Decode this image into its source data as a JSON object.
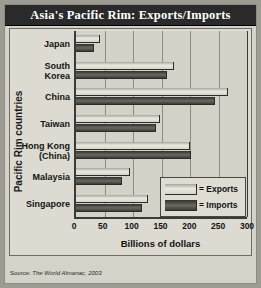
{
  "title": "Asia's Pacific Rim: Exports/Imports",
  "source": {
    "label": "Source:",
    "value": "The World Almanac, 2003"
  },
  "legend": {
    "exports": "= Exports",
    "imports": "= Imports"
  },
  "colors": {
    "title_bar": "#2a2a2a",
    "title_text": "#ffffff",
    "page_background": "#d4d2c9",
    "plot_background": "#d3d1c8",
    "exports_bar": "#d7d5cc",
    "imports_bar": "#3d3b37",
    "axis": "#3a3a36",
    "gridline": "#8d8b82"
  },
  "chart_data": {
    "type": "bar",
    "orientation": "horizontal",
    "title": "Asia's Pacific Rim: Exports/Imports",
    "xlabel": "Billions of dollars",
    "ylabel": "Pacific Rim countries",
    "xlim": [
      0,
      300
    ],
    "xticks": [
      0,
      50,
      100,
      150,
      200,
      250,
      300
    ],
    "xtick_labels": [
      "0",
      "50",
      "100",
      "150",
      "200",
      "250",
      "300"
    ],
    "grid": true,
    "legend_position": "inside-lower-right",
    "categories": [
      "Japan",
      "South Korea",
      "China",
      "Taiwan",
      "Hong Kong (China)",
      "Malaysia",
      "Singapore"
    ],
    "series": [
      {
        "name": "Exports",
        "values": [
          42,
          172,
          266,
          148,
          200,
          94,
          126
        ]
      },
      {
        "name": "Imports",
        "values": [
          32,
          160,
          244,
          140,
          202,
          80,
          116
        ]
      }
    ]
  }
}
